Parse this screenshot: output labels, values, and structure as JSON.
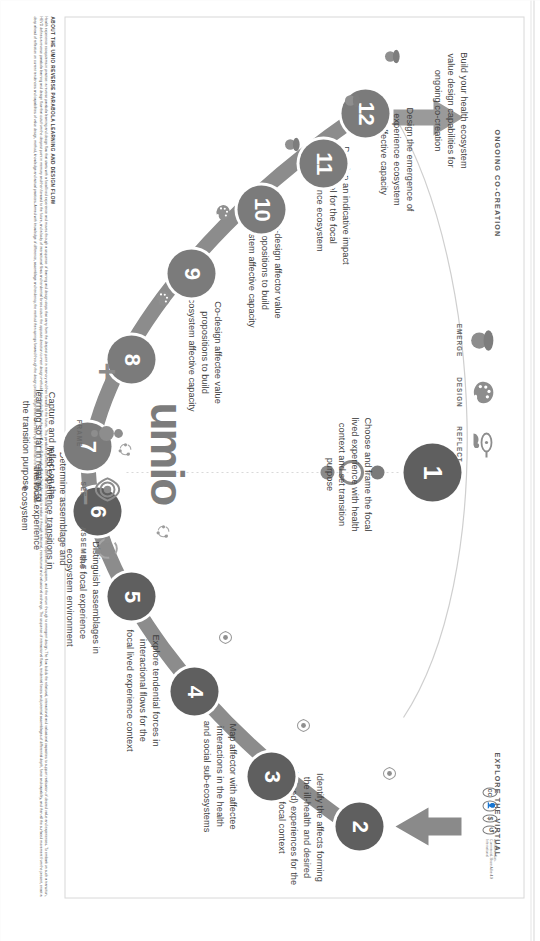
{
  "poster": {
    "brand": "umio",
    "phase_labels": {
      "ongoing": "ONGOING CO-CREATION",
      "explore": "EXPLORE THE VIRTUAL"
    },
    "axis_marks": {
      "plus": "+",
      "minus": "–"
    },
    "nodes": [
      {
        "num": "1",
        "caption": "Choose and frame the focal lived experience with health context and set transition purpose"
      },
      {
        "num": "2",
        "caption": "Identify the affects forming the ill-health and desired (valued) experiences for the focal context"
      },
      {
        "num": "3",
        "caption": "Map affector with affectee interactions in the health and social sub-ecosystems"
      },
      {
        "num": "4",
        "caption": "Explore tendential forces in interactional flows for the focal lived experience context"
      },
      {
        "num": "5",
        "caption": "Distinguish assemblages in the focal experience ecosystem environment"
      },
      {
        "num": "6",
        "caption": "Determine assemblage and lived experience transitions in the focal experience ecosystem"
      },
      {
        "num": "7",
        "caption": "Capture and reflect on the learning so far in relation to the transition purpose"
      },
      {
        "num": "8",
        "caption": "Co-design affectee value propositions to build ecosystem affective capacity"
      },
      {
        "num": "9",
        "caption": "Co-design affector value propositions to build ecosystem affective capacity"
      },
      {
        "num": "10",
        "caption": "Develop an indicative impact model for the focal experience ecosystem"
      },
      {
        "num": "11",
        "caption": "Design the emergence of experience ecosystem affective capacity"
      },
      {
        "num": "12",
        "caption": "Build your health ecosystem value design capabilities for ongoing co-creation"
      }
    ],
    "legend_top": [
      {
        "icon": "magnifier-icon",
        "label": "REFLECT"
      },
      {
        "icon": "palette-icon",
        "label": "DESIGN"
      },
      {
        "icon": "acorn-icon",
        "label": "EMERGE"
      }
    ],
    "legend_bottom": [
      {
        "icon": "frame-figure-icon",
        "label": "FRAME"
      },
      {
        "icon": "eye-icon",
        "label": "SEE"
      },
      {
        "icon": "assemble-icon",
        "label": "ASSEMBLE"
      }
    ],
    "footer": {
      "title": "ABOUT THE UMIO REVERSE PARABOLA LEARNING AND DESIGN FLOW",
      "body": "Health experience ecosystems in practice: a reverse parabola learning and design flow that starts with a focal lived experience and moves through a sequence of learning and design steps that carry from the deepest point in memory and then forward to the future. This parabola represents both the dive into actual and virtual realms of the experience ecosystem, and the return through to emergent design. The flow builds the relational, interactional and valuational capacities to support realisation of desired value and experiences. To embark on such a transition, HEVD defines a reverse parabola learning and design flow that cuts from the deepest point in memory and then forward to the future, and a body of interactional flows and tendential forces cuts in the opposite direction to meet design methods that tend to start in the present, a future through wisdom and then seek to realise it through relational, interactional and valuational exchange. The sequence of interactional flows, tendential forces and potential assemblages of differential depth, force and capability, and then all the surfaced movement from the present, enact a deep ahead of reflection on current tendencies and capabilities of value design, method, knowledge and actual practices. Armed with knowledge of difference, assemblage and tendency, the method then springs forward through the design process to generate novel offerings of all kinds to enact the desired transition."
    },
    "license": {
      "marks": [
        "CC",
        "BY",
        "NC",
        "SA"
      ],
      "text": "Attribution-Non-Commercial-Share Alike 4.0 International"
    }
  },
  "colors": {
    "node_dark": "#5f5f5f",
    "node_light": "#7b7b7b",
    "curve": "#8c8c8c",
    "text": "#3f3f3f",
    "page_bg": "#ffffff"
  }
}
